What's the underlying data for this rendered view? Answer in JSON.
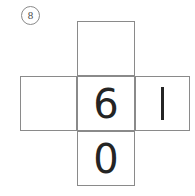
{
  "worksheet": {
    "problem_number": "8",
    "figure_type": "cube-net-cross",
    "line_color": "#8a8a8a",
    "digit_color": "#242424",
    "background_color": "#ffffff",
    "cells": [
      {
        "position": "top",
        "value": "",
        "has_value": false
      },
      {
        "position": "left",
        "value": "",
        "has_value": false
      },
      {
        "position": "center",
        "value": "6",
        "has_value": true
      },
      {
        "position": "right",
        "value": "1",
        "has_value": true
      },
      {
        "position": "bottom",
        "value": "0",
        "has_value": true
      }
    ]
  }
}
